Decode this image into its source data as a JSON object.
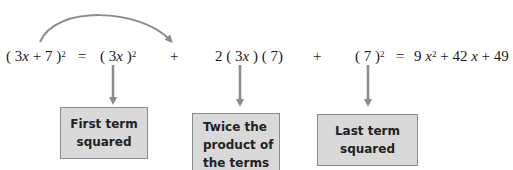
{
  "diagram": {
    "title_fragment": "p(y) = (x ... )",
    "equation": {
      "lhs": {
        "open": "( 3",
        "var": "x",
        "rest": " + 7 )",
        "exp": "2"
      },
      "eq1": "=",
      "term1": {
        "open": "( 3",
        "var": "x",
        "close": " )",
        "exp": "2"
      },
      "plus1": "+",
      "term2": {
        "pre": "2 ( 3",
        "var": "x",
        "post": " ) ( 7)"
      },
      "plus2": "+",
      "term3": {
        "base": "( 7 )",
        "exp": "2"
      },
      "eq2": "=",
      "result": {
        "c1": "9 ",
        "v1": "x",
        "e1": "2",
        "mid": " + 42 ",
        "v2": "x",
        "tail": " + 49"
      }
    },
    "boxes": [
      {
        "line1": "First  term",
        "line2": "squared"
      },
      {
        "line1": "Twice the",
        "line2": "product of",
        "line3": "the terms"
      },
      {
        "line1": "Last  term",
        "line2": "squared"
      }
    ],
    "colors": {
      "arrow": "#8a8a8a",
      "box_fill": "#d9d9d9",
      "box_border": "#8c8c8c",
      "text": "#1a1a1a"
    }
  }
}
